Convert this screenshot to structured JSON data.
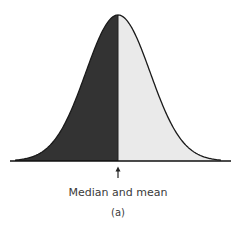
{
  "chart_data": {
    "type": "area",
    "title": "",
    "distribution": "normal",
    "mean": 0,
    "median": 0,
    "std_dev": 1,
    "x_range": [
      -3.2,
      3.2
    ],
    "regions": [
      {
        "name": "below-mean",
        "from": -3.2,
        "to": 0,
        "color": "#333333"
      },
      {
        "name": "above-mean",
        "from": 0,
        "to": 3.2,
        "color": "#eaeaea"
      }
    ],
    "annotation": {
      "text": "Median and mean",
      "x": 0,
      "marker": "up-arrow"
    },
    "panel_label": "(a)",
    "xlabel": "",
    "ylabel": "",
    "grid": false,
    "legend": "none"
  },
  "colors": {
    "curve": "#1a1a1a",
    "axis": "#111111",
    "text": "#3a3a3a"
  }
}
